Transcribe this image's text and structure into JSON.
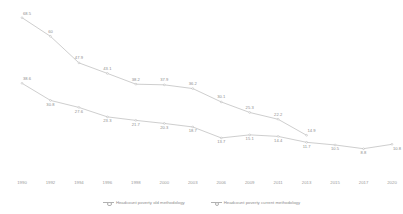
{
  "chart_data": {
    "type": "line",
    "title": "",
    "subtitle": "",
    "xlabel": "",
    "ylabel": "",
    "grid": false,
    "legend_position": "bottom",
    "xlim": [
      0,
      13
    ],
    "ylim": [
      0,
      72
    ],
    "categories": [
      "1990",
      "1992",
      "1994",
      "1996",
      "1998",
      "2000",
      "2003",
      "2006",
      "2009",
      "2011",
      "2013",
      "2015",
      "2017",
      "2020"
    ],
    "series": [
      {
        "name": "Headcount poverty old methodology",
        "color": "#a6a6a6",
        "values": [
          68.5,
          60,
          47.9,
          43.1,
          38.2,
          37.9,
          36.2,
          30.1,
          25.3,
          22.2,
          14.9,
          null,
          null,
          null
        ],
        "labels": [
          "68.5",
          "60",
          "47.9",
          "43.1",
          "38.2",
          "37.9",
          "36.2",
          "30.1",
          "25.3",
          "22.2",
          "14.9"
        ]
      },
      {
        "name": "Headcount poverty current methodology",
        "color": "#a6a6a6",
        "values": [
          38.6,
          30.8,
          27.6,
          23.3,
          21.7,
          20.3,
          18.7,
          13.7,
          15.1,
          14.4,
          11.7,
          10.5,
          8.8,
          10.8
        ],
        "labels": [
          "38.6",
          "30.8",
          "27.6",
          "23.3",
          "21.7",
          "20.3",
          "18.7",
          "13.7",
          "15.1",
          "14.4",
          "11.7",
          "10.5",
          "8.8",
          "10.8"
        ]
      }
    ]
  },
  "legend": {
    "items": [
      {
        "label": "Headcount poverty old methodology"
      },
      {
        "label": "Headcount poverty current methodology"
      }
    ]
  }
}
